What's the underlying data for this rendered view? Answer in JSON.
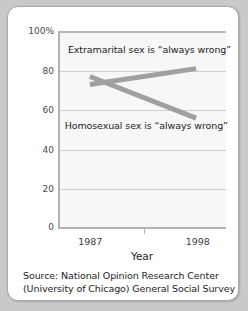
{
  "chart_data": {
    "type": "line",
    "title": "",
    "xlabel": "Year",
    "ylabel": "",
    "x": [
      "1987",
      "1998"
    ],
    "categories": [
      "1987",
      "1998"
    ],
    "ylim": [
      0,
      100
    ],
    "xlim_pad": 0.18,
    "grid": true,
    "legend_position": "inline-annotations",
    "ytick_labels": [
      "100%",
      "80",
      "60",
      "40",
      "20",
      "0"
    ],
    "ytick_values": [
      100,
      80,
      60,
      40,
      20,
      0
    ],
    "xtick_labels": [
      "1987",
      "1998"
    ],
    "series": [
      {
        "name": "Extramarital sex is “always wrong”",
        "values": [
          73,
          81
        ],
        "color": "#a0a0a0",
        "annotation": "Extramarital sex is “always wrong”"
      },
      {
        "name": "Homosexual sex is “always wrong”",
        "values": [
          77,
          56
        ],
        "color": "#a0a0a0",
        "annotation": "Homosexual sex is “always wrong”"
      }
    ],
    "line_color": "#a0a0a0",
    "line_width": 5,
    "plot_background": "#f7f7f7"
  },
  "axis": {
    "x_title": "Year"
  },
  "caption": {
    "line1": "Source: National Opinion Research Center",
    "line2": "(University of Chicago) General Social Survey"
  }
}
